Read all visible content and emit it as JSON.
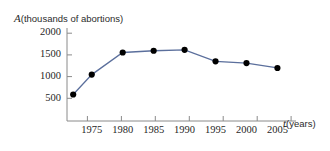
{
  "chart_data": {
    "type": "line",
    "title": "",
    "subtitle": "",
    "xlabel_var": "t",
    "xlabel_unit": "(years)",
    "ylabel_var": "A",
    "ylabel_unit": "(thousands of abortions)",
    "x": [
      1972,
      1975,
      1980,
      1985,
      1990,
      1995,
      2000,
      2005
    ],
    "values": [
      600,
      1050,
      1550,
      1590,
      1610,
      1350,
      1310,
      1200
    ],
    "series": [
      {
        "name": "A (thousands of abortions)",
        "values": [
          600,
          1050,
          1550,
          1590,
          1610,
          1350,
          1310,
          1200
        ]
      }
    ],
    "xlim": [
      1971,
      2008
    ],
    "ylim": [
      0,
      2150
    ],
    "xticks": [
      1975,
      1980,
      1985,
      1990,
      1995,
      2000,
      2005
    ],
    "xtick_labels": [
      "1975",
      "1980",
      "1985",
      "1990",
      "1995",
      "2000",
      "2005"
    ],
    "yticks": [
      500,
      1000,
      1500,
      2000
    ],
    "ytick_labels": [
      "500",
      "1000",
      "1500",
      "2000"
    ],
    "grid": false,
    "legend": "none",
    "line_color": "#5b6f9c",
    "marker_color": "#000000",
    "axis_color": "#7d7d7d",
    "marker_style": "filled-circle"
  }
}
